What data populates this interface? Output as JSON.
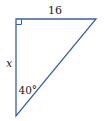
{
  "diagram": {
    "type": "right-triangle",
    "line_color": "#3b5fa8",
    "text_color": "#222222",
    "vertices": {
      "right_angle": [
        16,
        19
      ],
      "top_right": [
        96,
        19
      ],
      "bottom": [
        16,
        116
      ]
    },
    "labels": {
      "top_side": "16",
      "left_side": "x",
      "angle": "40°"
    }
  }
}
